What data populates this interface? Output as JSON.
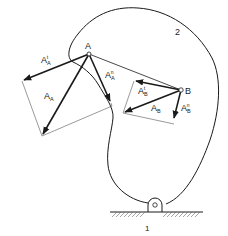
{
  "diagram": {
    "title": "",
    "labels": {
      "link_number": "2",
      "ground_number": "1",
      "point_a": "A",
      "point_b": "B",
      "acc_a_tangential": {
        "base": "A",
        "sub": "A",
        "sup": "t"
      },
      "acc_a_normal": {
        "base": "A",
        "sub": "A",
        "sup": "n"
      },
      "acc_a_total": {
        "base": "A",
        "sub": "A"
      },
      "acc_b_tangential": {
        "base": "A",
        "sub": "B",
        "sup": "t"
      },
      "acc_b_normal": {
        "base": "A",
        "sub": "B",
        "sup": "n"
      },
      "acc_b_total": {
        "base": "A",
        "sub": "B"
      }
    },
    "points": {
      "A": [
        89,
        54
      ],
      "B": [
        181,
        90
      ],
      "O": [
        155,
        208
      ]
    },
    "vectors": [
      {
        "name": "A_A^t",
        "from": "A",
        "to": [
          22,
          81
        ],
        "style": "bold"
      },
      {
        "name": "A_A^n",
        "from": "A",
        "to": [
          111,
          103
        ],
        "style": "bold"
      },
      {
        "name": "A_A",
        "from": "A",
        "to": [
          42,
          136
        ],
        "style": "bold"
      },
      {
        "name": "A_B^t",
        "from": "B",
        "to": [
          134,
          81
        ],
        "style": "bold"
      },
      {
        "name": "A_B^n",
        "from": "B",
        "to": [
          174,
          120
        ],
        "style": "bold"
      },
      {
        "name": "A_B",
        "from": "B",
        "to": [
          123,
          113
        ],
        "style": "bold"
      }
    ],
    "colors": {
      "line": "#1a1a1a",
      "construction": "#555555",
      "background": "#ffffff"
    }
  }
}
